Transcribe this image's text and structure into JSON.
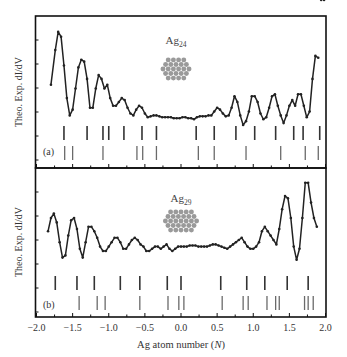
{
  "chart_data": [
    {
      "type": "line",
      "panel": "(a)",
      "title": "Ag24",
      "title_base": "Ag",
      "title_sub": "24",
      "xlabel": "Ag atom number (N)",
      "ylabel": "Theo. Exp. dI/dV",
      "xlim": [
        -2.0,
        2.0
      ],
      "grid": false,
      "series": [
        {
          "name": "Exp. dI/dV",
          "x": [
            -1.8,
            -1.74,
            -1.7,
            -1.66,
            -1.62,
            -1.58,
            -1.54,
            -1.5,
            -1.46,
            -1.42,
            -1.38,
            -1.34,
            -1.3,
            -1.26,
            -1.22,
            -1.18,
            -1.14,
            -1.1,
            -1.06,
            -1.02,
            -0.98,
            -0.94,
            -0.9,
            -0.86,
            -0.82,
            -0.78,
            -0.74,
            -0.7,
            -0.66,
            -0.62,
            -0.58,
            -0.54,
            -0.5,
            -0.46,
            -0.42,
            -0.38,
            -0.34,
            -0.3,
            -0.26,
            -0.22,
            -0.18,
            -0.14,
            -0.1,
            -0.06,
            -0.02,
            0.02,
            0.06,
            0.1,
            0.14,
            0.18,
            0.22,
            0.26,
            0.3,
            0.34,
            0.38,
            0.42,
            0.46,
            0.5,
            0.54,
            0.58,
            0.62,
            0.66,
            0.7,
            0.74,
            0.78,
            0.82,
            0.86,
            0.9,
            0.94,
            0.98,
            1.02,
            1.06,
            1.1,
            1.14,
            1.18,
            1.22,
            1.26,
            1.3,
            1.34,
            1.38,
            1.42,
            1.46,
            1.5,
            1.54,
            1.58,
            1.62,
            1.66,
            1.7,
            1.74,
            1.78,
            1.82,
            1.86,
            1.9,
            1.94,
            1.98
          ],
          "y": [
            0.42,
            0.78,
            0.97,
            0.92,
            0.62,
            0.28,
            0.1,
            0.16,
            0.38,
            0.6,
            0.68,
            0.66,
            0.48,
            0.18,
            0.18,
            0.38,
            0.52,
            0.48,
            0.38,
            0.42,
            0.28,
            0.2,
            0.2,
            0.24,
            0.28,
            0.26,
            0.18,
            0.12,
            0.1,
            0.16,
            0.2,
            0.18,
            0.12,
            0.08,
            0.09,
            0.1,
            0.1,
            0.09,
            0.08,
            0.08,
            0.08,
            0.08,
            0.07,
            0.07,
            0.07,
            0.08,
            0.08,
            0.07,
            0.07,
            0.06,
            0.08,
            0.09,
            0.09,
            0.09,
            0.1,
            0.1,
            0.14,
            0.18,
            0.16,
            0.12,
            0.09,
            0.1,
            0.18,
            0.3,
            0.24,
            0.1,
            0.0,
            0.04,
            0.14,
            0.3,
            0.3,
            0.24,
            0.12,
            0.06,
            0.08,
            0.18,
            0.3,
            0.32,
            0.2,
            0.1,
            0.02,
            0.1,
            0.2,
            0.26,
            0.2,
            0.32,
            0.32,
            0.2,
            0.08,
            0.14,
            0.48,
            0.72,
            0.7
          ],
          "color": "#222222"
        }
      ],
      "theory_levels": [
        -1.62,
        -1.3,
        -1.08,
        -1.0,
        -0.79,
        -0.54,
        -0.34,
        0.21,
        0.46,
        0.76,
        1.02,
        1.31,
        1.56,
        1.69,
        1.92
      ],
      "experiment_levels": [
        -1.61,
        -1.5,
        -1.08,
        -0.61,
        -0.53,
        -0.34,
        0.24,
        0.46,
        0.9,
        1.38,
        1.72,
        1.9
      ]
    },
    {
      "type": "line",
      "panel": "(b)",
      "title": "Ag29",
      "title_base": "Ag",
      "title_sub": "29",
      "xlabel": "Ag atom number (N)",
      "ylabel": "Theo. Exp. dI/dV",
      "xlim": [
        -2.0,
        2.0
      ],
      "grid": false,
      "series": [
        {
          "name": "Exp. dI/dV",
          "x": [
            -1.84,
            -1.8,
            -1.76,
            -1.72,
            -1.68,
            -1.64,
            -1.6,
            -1.56,
            -1.52,
            -1.48,
            -1.44,
            -1.4,
            -1.36,
            -1.32,
            -1.28,
            -1.24,
            -1.2,
            -1.16,
            -1.12,
            -1.08,
            -1.04,
            -1.0,
            -0.96,
            -0.92,
            -0.88,
            -0.84,
            -0.8,
            -0.76,
            -0.72,
            -0.68,
            -0.64,
            -0.6,
            -0.56,
            -0.52,
            -0.48,
            -0.44,
            -0.4,
            -0.36,
            -0.32,
            -0.28,
            -0.24,
            -0.2,
            -0.16,
            -0.12,
            -0.08,
            -0.04,
            0.0,
            0.04,
            0.08,
            0.12,
            0.16,
            0.2,
            0.24,
            0.28,
            0.32,
            0.36,
            0.4,
            0.44,
            0.48,
            0.52,
            0.56,
            0.6,
            0.64,
            0.68,
            0.72,
            0.76,
            0.8,
            0.84,
            0.88,
            0.92,
            0.96,
            1.0,
            1.04,
            1.08,
            1.12,
            1.16,
            1.2,
            1.24,
            1.28,
            1.32,
            1.36,
            1.4,
            1.44,
            1.48,
            1.52,
            1.56,
            1.6,
            1.64,
            1.68,
            1.72,
            1.76,
            1.8,
            1.84,
            1.88
          ],
          "y": [
            0.18,
            0.3,
            0.34,
            0.26,
            0.08,
            -0.06,
            -0.04,
            0.14,
            0.28,
            0.3,
            0.2,
            0.02,
            -0.06,
            0.08,
            0.22,
            0.22,
            0.18,
            0.12,
            0.04,
            0.0,
            0.0,
            0.04,
            0.08,
            0.12,
            0.12,
            0.08,
            0.02,
            0.02,
            0.06,
            0.1,
            0.12,
            0.1,
            0.06,
            0.04,
            0.0,
            0.0,
            0.02,
            0.04,
            0.04,
            0.02,
            0.04,
            0.06,
            0.02,
            0.0,
            0.02,
            0.04,
            0.04,
            0.04,
            0.04,
            0.05,
            0.05,
            0.05,
            0.04,
            0.04,
            0.04,
            0.04,
            0.05,
            0.06,
            0.06,
            0.05,
            0.04,
            0.03,
            0.02,
            0.04,
            0.06,
            0.08,
            0.1,
            0.12,
            0.08,
            0.04,
            0.02,
            0.02,
            0.04,
            0.08,
            0.18,
            0.22,
            0.18,
            0.14,
            0.1,
            0.06,
            0.2,
            0.38,
            0.5,
            0.48,
            0.3,
            0.04,
            -0.08,
            0.02,
            0.3,
            0.62,
            0.62,
            0.44,
            0.3,
            0.22
          ],
          "color": "#222222"
        }
      ],
      "theory_levels": [
        -1.74,
        -1.44,
        -1.2,
        -0.84,
        -0.57,
        -0.19,
        0.0,
        0.55,
        0.91,
        1.16,
        1.47,
        1.76
      ],
      "experiment_levels": [
        -1.41,
        -1.16,
        -1.05,
        -0.57,
        -0.18,
        -0.03,
        0.04,
        0.57,
        0.86,
        0.93,
        1.19,
        1.31,
        1.36,
        1.71,
        1.76,
        1.83
      ]
    }
  ],
  "axis": {
    "x_ticks": [
      "-2.0",
      "-1.5",
      "-1.0",
      "-0.5",
      "0.0",
      "0.5",
      "1.0",
      "1.5",
      "2.0"
    ],
    "xlabel_text": "Ag atom number (",
    "xlabel_var": "N",
    "xlabel_close": ")",
    "ylabel_top": "Theo. Exp. dI/dV",
    "ylabel_bottom": "Theo. Exp. dI/dV"
  },
  "panels": {
    "a": {
      "tag": "(a)",
      "cluster_base": "Ag",
      "cluster_sub": "24",
      "cluster_icon": "ag24-cluster-icon"
    },
    "b": {
      "tag": "(b)",
      "cluster_base": "Ag",
      "cluster_sub": "29",
      "cluster_icon": "ag29-cluster-icon"
    }
  },
  "colors": {
    "line": "#222222",
    "axes": "#111111",
    "theory_bar": "#333333",
    "experiment_bar": "#6a6a6a",
    "cluster_atom": "#9a9a9a"
  }
}
